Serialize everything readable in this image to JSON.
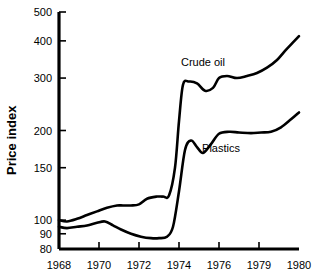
{
  "chart_data": {
    "type": "line",
    "title": "",
    "xlabel": "",
    "ylabel": "Price index",
    "yscale": "log",
    "ylim": [
      80,
      500
    ],
    "xlim": [
      1968,
      1980
    ],
    "grid": false,
    "legend_position": "inline-annotation",
    "ytick_labels": [
      "500",
      "400",
      "300",
      "200",
      "150",
      "100",
      "90",
      "80"
    ],
    "ytick_values": [
      500,
      400,
      300,
      200,
      150,
      100,
      90,
      80
    ],
    "xtick_labels": [
      "1968",
      "1970",
      "1972",
      "1974",
      "1976",
      "1979",
      "1980"
    ],
    "xtick_values": [
      1968,
      1970,
      1972,
      1974,
      1976,
      1978,
      1980
    ],
    "annotations": [
      {
        "text": "Crude oil",
        "x": 1975.2,
        "y": 330
      },
      {
        "text": "Plastics",
        "x": 1976.1,
        "y": 170
      }
    ],
    "series": [
      {
        "name": "Crude oil",
        "color": "#000000",
        "x": [
          1968.0,
          1968.4,
          1968.9,
          1969.4,
          1969.9,
          1970.4,
          1970.9,
          1971.2,
          1971.6,
          1972.0,
          1972.4,
          1972.9,
          1973.2,
          1973.5,
          1973.8,
          1974.0,
          1974.2,
          1974.5,
          1974.9,
          1975.3,
          1975.7,
          1976.0,
          1976.4,
          1976.9,
          1977.4,
          1977.9,
          1978.4,
          1978.9,
          1979.3,
          1979.7,
          1980.0
        ],
        "y": [
          100,
          99,
          101,
          104,
          107,
          110,
          112,
          112,
          112,
          113,
          118,
          120,
          120,
          121,
          150,
          215,
          285,
          292,
          288,
          272,
          278,
          300,
          305,
          300,
          305,
          312,
          325,
          345,
          370,
          395,
          415
        ]
      },
      {
        "name": "Plastics",
        "color": "#000000",
        "x": [
          1968.0,
          1968.4,
          1968.9,
          1969.4,
          1969.9,
          1970.3,
          1970.7,
          1971.1,
          1971.6,
          1972.1,
          1972.6,
          1973.0,
          1973.4,
          1973.7,
          1974.0,
          1974.3,
          1974.6,
          1974.9,
          1975.2,
          1975.6,
          1976.0,
          1976.5,
          1977.0,
          1977.6,
          1978.1,
          1978.6,
          1979.1,
          1979.6,
          1980.0
        ],
        "y": [
          95,
          94,
          95,
          96,
          98,
          99,
          96,
          93,
          90,
          88,
          87,
          87,
          88,
          95,
          125,
          172,
          185,
          176,
          168,
          180,
          195,
          198,
          197,
          196,
          197,
          198,
          205,
          218,
          230
        ]
      }
    ]
  }
}
